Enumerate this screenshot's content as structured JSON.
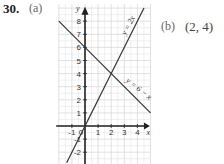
{
  "question": {
    "number": "30.",
    "part_a_label": "(a)",
    "part_b_label": "(b)",
    "part_b_answer": "(2, 4)"
  },
  "chart_data": {
    "type": "line",
    "title": "",
    "xlabel": "x",
    "ylabel": "y",
    "xlim": [
      -2,
      5
    ],
    "ylim": [
      -3,
      9
    ],
    "grid": true,
    "x_ticks": [
      "-1",
      "0",
      "1",
      "2",
      "3",
      "4"
    ],
    "y_ticks": [
      "-2",
      "-1",
      "1",
      "2",
      "3",
      "4",
      "5",
      "6",
      "7",
      "8"
    ],
    "series": [
      {
        "name": "y = 2x",
        "x": [
          -1.4,
          4.5
        ],
        "y": [
          -2.8,
          9
        ]
      },
      {
        "name": "y = 6 − x",
        "x": [
          -2,
          5
        ],
        "y": [
          8,
          1
        ]
      }
    ],
    "intersection": {
      "x": 2,
      "y": 4
    }
  }
}
